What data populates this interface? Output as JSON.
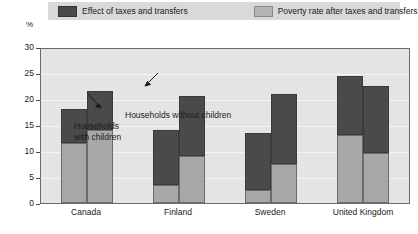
{
  "legend": {
    "items": [
      {
        "label": "Effect of taxes and transfers",
        "color": "#4a4a4a",
        "swatch": "dark-swatch"
      },
      {
        "label": "Poverty rate after taxes and transfers",
        "color": "#b4b4b4",
        "swatch": "light-swatch"
      }
    ]
  },
  "axis": {
    "unit": "%",
    "ticks": [
      "30",
      "25",
      "20",
      "15",
      "10",
      "5",
      "0"
    ]
  },
  "annotations": [
    {
      "id": "with-children",
      "text": "Households\nwith children",
      "line1": "Households",
      "line2": "with children"
    },
    {
      "id": "without-children",
      "text": "Households without children",
      "line1": "Households without children",
      "line2": ""
    }
  ],
  "chart_data": {
    "type": "bar",
    "title": "",
    "subtitle": "",
    "xlabel": "",
    "ylabel": "%",
    "ylim": [
      0,
      30
    ],
    "yticks": [
      0,
      5,
      10,
      15,
      20,
      25,
      30
    ],
    "grid": true,
    "stacked": true,
    "legend_position": "top",
    "categories": [
      "Canada",
      "Finland",
      "Sweden",
      "United Kingdom"
    ],
    "subcategories": [
      "Households with children",
      "Households without children"
    ],
    "series": [
      {
        "name": "Poverty rate after taxes and transfers",
        "color": "#a8a8a8",
        "values_with_children": [
          11.5,
          3.5,
          2.5,
          13.0
        ],
        "values_without_children": [
          14.0,
          9.0,
          7.5,
          9.7
        ]
      },
      {
        "name": "Effect of taxes and transfers",
        "color": "#4a4a4a",
        "values_with_children": [
          6.5,
          10.5,
          11.0,
          11.5
        ],
        "values_without_children": [
          7.5,
          11.5,
          13.5,
          12.8
        ]
      }
    ],
    "totals_with_children": [
      18.0,
      14.0,
      13.5,
      24.5
    ],
    "totals_without_children": [
      21.5,
      20.5,
      21.0,
      22.5
    ]
  }
}
